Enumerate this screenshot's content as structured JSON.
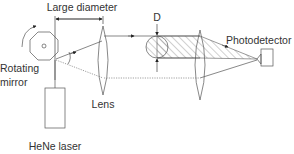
{
  "diagram": {
    "labels": {
      "large_diameter": "Large diameter",
      "d": "D",
      "rotating": "Rotating",
      "mirror": "mirror",
      "lens": "Lens",
      "photodetector": "Photodetector",
      "hene_laser": "HeNe laser"
    },
    "components": [
      "rotating-mirror",
      "hene-laser",
      "lens-1",
      "sample-particle",
      "lens-2",
      "photodetector"
    ],
    "colors": {
      "line": "#555555",
      "text": "#333333",
      "hatch": "#777777"
    }
  }
}
